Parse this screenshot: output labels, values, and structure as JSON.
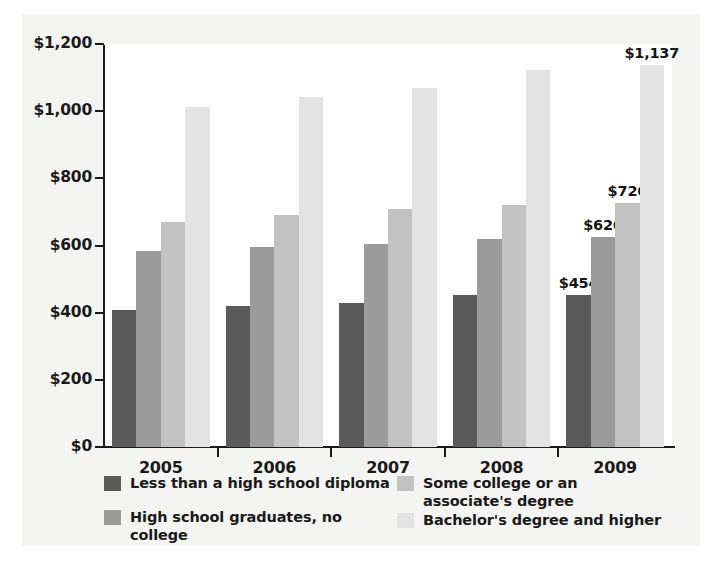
{
  "chart_data": {
    "type": "bar",
    "title": "",
    "subtitle": "",
    "xlabel": "",
    "ylabel": "",
    "categories": [
      "2005",
      "2006",
      "2007",
      "2008",
      "2009"
    ],
    "ylim": [
      0,
      1200
    ],
    "ytick_values": [
      0,
      200,
      400,
      600,
      800,
      1000,
      1200
    ],
    "ytick_labels": [
      "$0",
      "$200",
      "$400",
      "$600",
      "$800",
      "$1,000",
      "$1,200"
    ],
    "grid": false,
    "legend_position": "bottom",
    "series": [
      {
        "name": "Less than a high school diploma",
        "color": "#5a5a5a",
        "values": [
          409,
          419,
          428,
          453,
          454
        ],
        "labels": [
          "",
          "",
          "",
          "",
          "$454"
        ]
      },
      {
        "name": "High school graduates, no college",
        "color": "#9b9b9b",
        "values": [
          583,
          595,
          604,
          618,
          626
        ],
        "labels": [
          "",
          "",
          "",
          "",
          "$626"
        ]
      },
      {
        "name": "Some college or an associate's degree",
        "color": "#c2c2c2",
        "values": [
          671,
          692,
          708,
          721,
          726
        ],
        "labels": [
          "",
          "",
          "",
          "",
          "$726"
        ]
      },
      {
        "name": "Bachelor's degree and higher",
        "color": "#e3e3e3",
        "values": [
          1013,
          1043,
          1070,
          1124,
          1137
        ],
        "labels": [
          "",
          "",
          "",
          "",
          "$1,137"
        ]
      }
    ]
  },
  "legend": {
    "items": [
      {
        "label": "Less than a high school diploma",
        "color": "#5a5a5a"
      },
      {
        "label": "High school graduates, no college",
        "color": "#9b9b9b"
      },
      {
        "label": "Some college or an\nassociate's degree",
        "color": "#c2c2c2"
      },
      {
        "label": "Bachelor's degree and higher",
        "color": "#e3e3e3"
      }
    ]
  },
  "colors": {
    "page_background": "#ffffff",
    "card_background": "#f4f4f2",
    "plot_background": "#ffffff",
    "axis": "#1a1a1a",
    "text": "#1a1a1a"
  }
}
